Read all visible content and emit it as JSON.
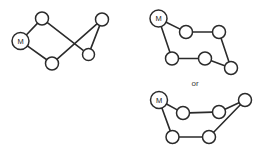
{
  "figure": {
    "title": "",
    "background_color": "#ffffff",
    "stroke_color": "#2b2b2b",
    "node_fill_color": "#ffffff",
    "connector_text": "or",
    "marked_node_label": "M",
    "diagrams": [
      {
        "id": "left-graph",
        "name": "crossed-cycle-graph",
        "nodes": [
          {
            "id": "L0",
            "label": "M",
            "marked": true,
            "cx": 20.5,
            "cy": 41.0,
            "r": 8.5
          },
          {
            "id": "L1",
            "label": "",
            "marked": false,
            "cx": 42.0,
            "cy": 18.5,
            "r": 6.5
          },
          {
            "id": "L2",
            "label": "",
            "marked": false,
            "cx": 52.0,
            "cy": 63.5,
            "r": 6.5
          },
          {
            "id": "L3",
            "label": "",
            "marked": false,
            "cx": 88.5,
            "cy": 54.5,
            "r": 6.0
          },
          {
            "id": "L4",
            "label": "",
            "marked": false,
            "cx": 102.0,
            "cy": 19.5,
            "r": 6.5
          }
        ],
        "edges": [
          {
            "from": "L0",
            "to": "L1"
          },
          {
            "from": "L0",
            "to": "L2"
          },
          {
            "from": "L1",
            "to": "L3"
          },
          {
            "from": "L2",
            "to": "L4"
          },
          {
            "from": "L3",
            "to": "L4"
          }
        ]
      },
      {
        "id": "top-right-graph",
        "name": "hexagon-chain-graph",
        "nodes": [
          {
            "id": "T0",
            "label": "M",
            "marked": true,
            "cx": 158.5,
            "cy": 18.5,
            "r": 8.5
          },
          {
            "id": "T1",
            "label": "",
            "marked": false,
            "cx": 186.0,
            "cy": 32.0,
            "r": 6.5
          },
          {
            "id": "T2",
            "label": "",
            "marked": false,
            "cx": 219.0,
            "cy": 32.0,
            "r": 6.5
          },
          {
            "id": "T3",
            "label": "",
            "marked": false,
            "cx": 231.0,
            "cy": 68.0,
            "r": 6.5
          },
          {
            "id": "T4",
            "label": "",
            "marked": false,
            "cx": 205.0,
            "cy": 58.5,
            "r": 6.5
          },
          {
            "id": "T5",
            "label": "",
            "marked": false,
            "cx": 172.0,
            "cy": 58.5,
            "r": 6.5
          }
        ],
        "edges": [
          {
            "from": "T0",
            "to": "T1"
          },
          {
            "from": "T1",
            "to": "T2"
          },
          {
            "from": "T2",
            "to": "T3"
          },
          {
            "from": "T3",
            "to": "T4"
          },
          {
            "from": "T4",
            "to": "T5"
          },
          {
            "from": "T5",
            "to": "T0"
          }
        ]
      },
      {
        "id": "bottom-right-graph",
        "name": "pinched-hexagon-graph",
        "nodes": [
          {
            "id": "B0",
            "label": "M",
            "marked": true,
            "cx": 159.0,
            "cy": 100.0,
            "r": 8.5
          },
          {
            "id": "B1",
            "label": "",
            "marked": false,
            "cx": 183.0,
            "cy": 113.0,
            "r": 6.5
          },
          {
            "id": "B2",
            "label": "",
            "marked": false,
            "cx": 219.0,
            "cy": 112.0,
            "r": 6.5
          },
          {
            "id": "B3",
            "label": "",
            "marked": false,
            "cx": 245.0,
            "cy": 100.0,
            "r": 6.5
          },
          {
            "id": "B4",
            "label": "",
            "marked": false,
            "cx": 209.0,
            "cy": 137.0,
            "r": 6.5
          },
          {
            "id": "B5",
            "label": "",
            "marked": false,
            "cx": 172.5,
            "cy": 137.0,
            "r": 6.5
          }
        ],
        "edges": [
          {
            "from": "B0",
            "to": "B1"
          },
          {
            "from": "B1",
            "to": "B2"
          },
          {
            "from": "B2",
            "to": "B3"
          },
          {
            "from": "B3",
            "to": "B4"
          },
          {
            "from": "B4",
            "to": "B5"
          },
          {
            "from": "B5",
            "to": "B0"
          }
        ]
      }
    ],
    "connector": {
      "x": 195.0,
      "y": 83.0,
      "text": "or"
    }
  }
}
